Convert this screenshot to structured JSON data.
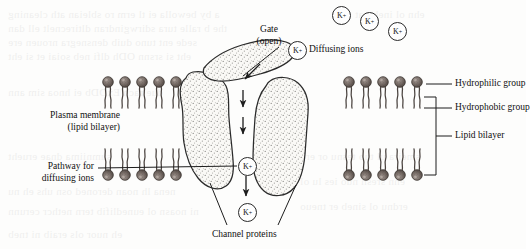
{
  "figure": {
    "background_color": "#fdfdfc",
    "ink_color": "#1a1a1a",
    "lipid_head_color": "#6f635d",
    "protein_fill_color": "#f7f6f3"
  },
  "labels": {
    "plasma_membrane_line1": "Plasma membrane",
    "plasma_membrane_line2": "(lipid bilayer)",
    "pathway_line1": "Pathway for",
    "pathway_line2": "diffusing ions",
    "gate_line1": "Gate",
    "gate_line2": "(open)",
    "diffusing_ions": "Diffusing ions",
    "channel_proteins": "Channel proteins",
    "hydrophilic_group": "Hydrophilic group",
    "hydrophobic_group": "Hydrophobic group",
    "lipid_bilayer": "Lipid bilayer"
  },
  "ions": [
    {
      "id": "ion-top-1",
      "label": "K",
      "charge": "+",
      "x": 332,
      "y": 6
    },
    {
      "id": "ion-top-2",
      "label": "K",
      "charge": "+",
      "x": 360,
      "y": 12
    },
    {
      "id": "ion-top-3",
      "label": "K",
      "charge": "+",
      "x": 388,
      "y": 22
    },
    {
      "id": "ion-entry",
      "label": "K",
      "charge": "+",
      "x": 288,
      "y": 41
    },
    {
      "id": "ion-mid-channel",
      "label": "K",
      "charge": "+",
      "x": 238,
      "y": 157
    },
    {
      "id": "ion-exit",
      "label": "K",
      "charge": "+",
      "x": 238,
      "y": 203
    }
  ],
  "membrane": {
    "left_leaflet_heads": 5,
    "right_leaflet_heads": 5,
    "leaflets": 2
  },
  "structures": {
    "channel_protein_left": "channel-protein-left",
    "channel_protein_right": "channel-protein-right",
    "gate": "gate-open-blob"
  }
}
